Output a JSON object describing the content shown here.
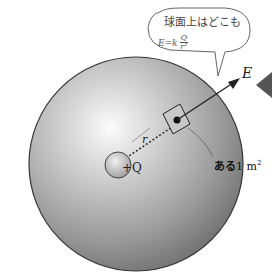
{
  "diagram": {
    "bubble": {
      "text": "球面上はどこも",
      "formula_lhs": "E=k",
      "formula_num": "Q",
      "formula_den": "r²"
    },
    "labels": {
      "field": "E",
      "radius": "r",
      "charge": "+Q",
      "area_prefix": "ある",
      "area_value": "1 m",
      "area_exp": "2"
    },
    "colors": {
      "sphere_light": "#f4f4f4",
      "sphere_dark": "#6e6e6e",
      "outline": "#333333",
      "arrow": "#222222",
      "side_marker": "#555555"
    }
  }
}
